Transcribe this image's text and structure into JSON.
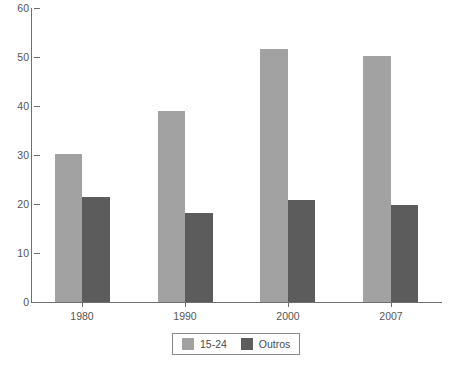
{
  "chart_data": {
    "type": "bar",
    "title": "",
    "subtitle": "",
    "xlabel": "",
    "ylabel": "",
    "categories": [
      "1980",
      "1990",
      "2000",
      "2007"
    ],
    "series": [
      {
        "name": "15-24",
        "color": "#a2a2a2",
        "values": [
          30.2,
          39.0,
          51.6,
          50.2
        ]
      },
      {
        "name": "Outros",
        "color": "#5c5c5c",
        "values": [
          21.4,
          18.2,
          20.8,
          19.8
        ]
      }
    ],
    "ylim": [
      0,
      60
    ],
    "yticks": [
      0,
      10,
      20,
      30,
      40,
      50,
      60
    ],
    "ytick_labels": [
      "0",
      "10",
      "20",
      "30",
      "40",
      "50",
      "60"
    ],
    "grid": false,
    "legend_position": "bottom",
    "background": "#ffffff",
    "axis_color": "#6f6f6f"
  }
}
